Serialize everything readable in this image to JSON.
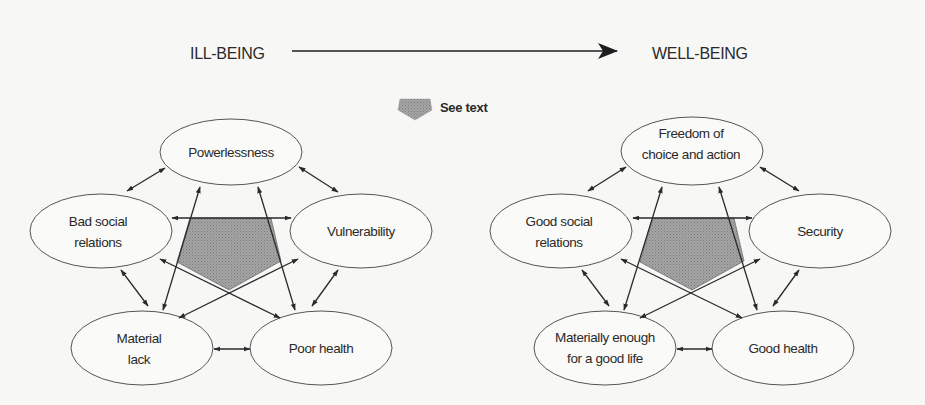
{
  "header": {
    "left_label": "ILL-BEING",
    "right_label": "WELL-BEING",
    "arrow": "progression-arrow"
  },
  "legend": {
    "icon": "shaded-pentagon-icon",
    "label": "See text"
  },
  "diagrams": [
    {
      "name": "ill-being",
      "nodes": [
        {
          "id": "top",
          "lines": [
            "Powerlessness"
          ]
        },
        {
          "id": "left",
          "lines": [
            "Bad social",
            "relations"
          ]
        },
        {
          "id": "right",
          "lines": [
            "Vulnerability"
          ]
        },
        {
          "id": "bottom_left",
          "lines": [
            "Material",
            "lack"
          ]
        },
        {
          "id": "bottom_right",
          "lines": [
            "Poor health"
          ]
        }
      ]
    },
    {
      "name": "well-being",
      "nodes": [
        {
          "id": "top",
          "lines": [
            "Freedom of",
            "choice and action"
          ]
        },
        {
          "id": "left",
          "lines": [
            "Good social",
            "relations"
          ]
        },
        {
          "id": "right",
          "lines": [
            "Security"
          ]
        },
        {
          "id": "bottom_left",
          "lines": [
            "Materially enough",
            "for a good life"
          ]
        },
        {
          "id": "bottom_right",
          "lines": [
            "Good health"
          ]
        }
      ]
    }
  ],
  "edges": [
    [
      "top",
      "left"
    ],
    [
      "top",
      "right"
    ],
    [
      "left",
      "bottom_left"
    ],
    [
      "right",
      "bottom_right"
    ],
    [
      "bottom_left",
      "bottom_right"
    ],
    [
      "left",
      "right"
    ],
    [
      "top",
      "bottom_left"
    ],
    [
      "top",
      "bottom_right"
    ],
    [
      "left",
      "bottom_right"
    ],
    [
      "right",
      "bottom_left"
    ]
  ],
  "colors": {
    "background": "#f7f7f5",
    "stroke": "#2a2a2a",
    "pentagon_fill": "#9a9a9a"
  }
}
